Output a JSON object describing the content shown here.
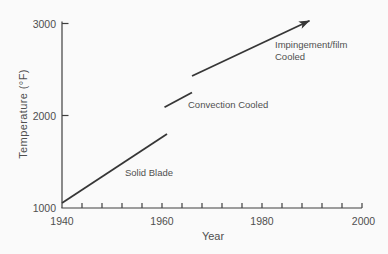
{
  "chart_data": {
    "type": "line",
    "title": "",
    "xlabel": "Year",
    "ylabel": "Temperature (°F)",
    "xlim": [
      1940,
      2000
    ],
    "ylim": [
      1000,
      3000
    ],
    "x_tick_values": [
      1940,
      1960,
      1980,
      2000
    ],
    "x_tick_labels": [
      "1940",
      "1960",
      "1980",
      "2000"
    ],
    "x_minor_tick_step": 4,
    "y_tick_values": [
      1000,
      2000,
      3000
    ],
    "y_tick_labels": [
      "1000",
      "2000",
      "3000"
    ],
    "grid": false,
    "legend_position": "none",
    "series": [
      {
        "name": "Solid Blade",
        "points": [
          [
            1940,
            1050
          ],
          [
            1961,
            1800
          ]
        ],
        "arrow": false
      },
      {
        "name": "Convection Cooled",
        "points": [
          [
            1960.5,
            2090
          ],
          [
            1966,
            2250
          ]
        ],
        "arrow": false
      },
      {
        "name": "Impingement/film Cooled",
        "points": [
          [
            1966,
            2430
          ],
          [
            1989.5,
            3030
          ]
        ],
        "arrow": true
      }
    ]
  },
  "labels": {
    "impingement_line1": "Impingement/film",
    "impingement_line2": "Cooled"
  },
  "colors": {
    "line": "#363636",
    "axis": "#3e3e3e",
    "text": "#4f4f4f",
    "background": "#fafafa"
  }
}
